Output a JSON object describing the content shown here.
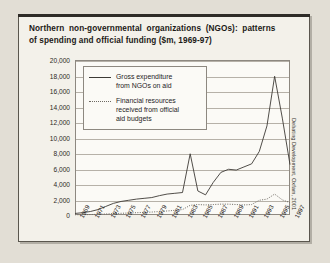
{
  "figure": {
    "title_line1": "Northern non-governmental organizations (NGOs): patterns",
    "title_line2": "of spending and official funding ($m, 1969-97)",
    "credit": "Debating Development, Oxfam, 2001"
  },
  "chart_data": {
    "type": "line",
    "title": "Northern non-governmental organizations (NGOs): patterns of spending and official funding ($m, 1969-97)",
    "xlabel": "",
    "ylabel": "",
    "ylim": [
      0,
      20000
    ],
    "ytick_step": 2000,
    "yticks": [
      "20,000",
      "18,000",
      "16,000",
      "14,000",
      "12,000",
      "10,000",
      "8,000",
      "6,000",
      "4,000",
      "2,000",
      "0"
    ],
    "ytick_values": [
      20000,
      18000,
      16000,
      14000,
      12000,
      10000,
      8000,
      6000,
      4000,
      2000,
      0
    ],
    "grid": true,
    "legend_position": "upper-left-inset",
    "xlim": [
      1969,
      1997
    ],
    "xticks": [
      "1969",
      "1971",
      "1973",
      "1975",
      "1977",
      "1979",
      "1981",
      "1983",
      "1985",
      "1987",
      "1989",
      "1991",
      "1993",
      "1995",
      "1997"
    ],
    "x": [
      1969,
      1970,
      1971,
      1972,
      1973,
      1974,
      1975,
      1976,
      1977,
      1978,
      1979,
      1980,
      1981,
      1982,
      1983,
      1984,
      1985,
      1986,
      1987,
      1988,
      1989,
      1990,
      1991,
      1992,
      1993,
      1994,
      1995,
      1996,
      1997
    ],
    "series": [
      {
        "name": "Gross expenditure from NGOs on aid",
        "style": "solid",
        "color": "#3d3a35",
        "values": [
          200,
          300,
          450,
          700,
          1100,
          1500,
          1750,
          1900,
          2050,
          2150,
          2250,
          2500,
          2700,
          2800,
          2900,
          7900,
          3100,
          2600,
          4200,
          5500,
          5900,
          5800,
          6200,
          6600,
          8200,
          11500,
          17900,
          12500,
          6500
        ]
      },
      {
        "name": "Financial resources received from official aid budgets",
        "style": "dotted",
        "color": "#6d6962",
        "values": [
          30,
          40,
          60,
          90,
          130,
          180,
          220,
          260,
          300,
          340,
          380,
          450,
          520,
          600,
          700,
          1250,
          1350,
          1300,
          1350,
          1400,
          1400,
          1350,
          1300,
          1350,
          1900,
          2050,
          2700,
          1950,
          1600
        ]
      }
    ]
  },
  "legend": {
    "items": [
      {
        "label_line1": "Gross expenditure",
        "label_line2": "from NGOs on aid",
        "label_line3": ""
      },
      {
        "label_line1": "Financial resources",
        "label_line2": "received from official",
        "label_line3": "aid budgets"
      }
    ]
  }
}
